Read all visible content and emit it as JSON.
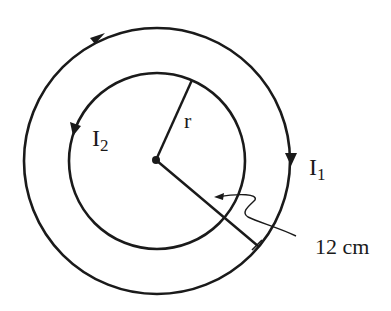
{
  "diagram": {
    "title": "",
    "colors": {
      "stroke": "#1a1a1a",
      "background": "#ffffff"
    },
    "outer_loop": {
      "label_main": "I",
      "label_sub": "1",
      "direction": "clockwise"
    },
    "inner_loop": {
      "label_main": "I",
      "label_sub": "2",
      "direction": "counter-clockwise"
    },
    "inner_radius_label": "r",
    "outer_radius_label": "12 cm"
  }
}
